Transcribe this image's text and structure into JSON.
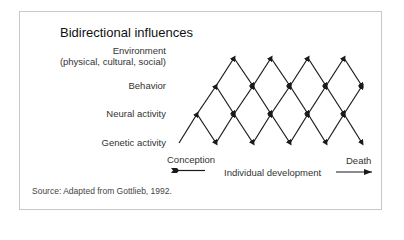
{
  "title": "Bidirectional influences",
  "levels": [
    {
      "label_line1": "Environment",
      "label_line2": "(physical, cultural, social)"
    },
    {
      "label": "Behavior"
    },
    {
      "label": "Neural activity"
    },
    {
      "label": "Genetic activity"
    }
  ],
  "timeline": {
    "start_label": "Conception",
    "middle_label": "Individual development",
    "end_label": "Death"
  },
  "source": "Source: Adapted from Gottlieb, 1992.",
  "colors": {
    "line": "#1a1a1a",
    "frame": "#c8c8c8",
    "text": "#333333"
  }
}
